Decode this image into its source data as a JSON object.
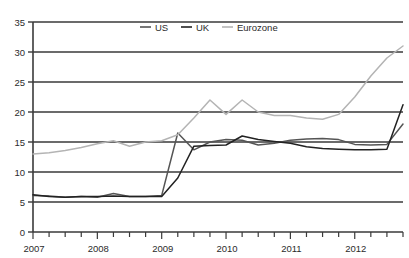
{
  "chart_data": {
    "type": "line",
    "title": "",
    "subtitle": "",
    "xlabel": "",
    "ylabel": "",
    "xlim": [
      2007.0,
      2012.75
    ],
    "ylim": [
      0,
      35
    ],
    "yticks": [
      0,
      5,
      10,
      15,
      20,
      25,
      30,
      35
    ],
    "xticks": [
      2007,
      2008,
      2009,
      2010,
      2011,
      2012
    ],
    "xtick_labels": [
      "2007",
      "2008",
      "2009",
      "2010",
      "2011",
      "2012"
    ],
    "minor_xtick_interval": 0.25,
    "grid": "horizontal",
    "legend_position": "top-center",
    "x": [
      2007.0,
      2007.25,
      2007.5,
      2007.75,
      2008.0,
      2008.25,
      2008.5,
      2008.75,
      2009.0,
      2009.25,
      2009.5,
      2009.75,
      2010.0,
      2010.25,
      2010.5,
      2010.75,
      2011.0,
      2011.25,
      2011.5,
      2011.75,
      2012.0,
      2012.25,
      2012.5,
      2012.75
    ],
    "series": [
      {
        "name": "US",
        "color": "#555555",
        "values": [
          6.1,
          6.0,
          5.8,
          5.9,
          5.8,
          6.4,
          5.9,
          5.9,
          6.1,
          16.5,
          13.7,
          15.0,
          15.4,
          15.3,
          14.5,
          14.8,
          15.3,
          15.5,
          15.6,
          15.4,
          14.6,
          14.5,
          14.6,
          18.0
        ]
      },
      {
        "name": "UK",
        "color": "#222222",
        "values": [
          6.2,
          5.9,
          5.8,
          5.9,
          5.9,
          6.0,
          5.9,
          5.9,
          5.9,
          9.0,
          14.3,
          14.4,
          14.5,
          16.0,
          15.4,
          15.1,
          14.8,
          14.2,
          13.9,
          13.8,
          13.7,
          13.7,
          13.8,
          21.2
        ]
      },
      {
        "name": "Eurozone",
        "color": "#b4b4b4",
        "values": [
          13.0,
          13.2,
          13.6,
          14.1,
          14.7,
          15.2,
          14.3,
          15.0,
          15.2,
          16.2,
          19.0,
          22.0,
          19.6,
          22.0,
          20.0,
          19.4,
          19.4,
          19.0,
          18.8,
          19.6,
          22.5,
          26.0,
          29.0,
          31.0
        ]
      }
    ],
    "legend": [
      {
        "label": "US",
        "color": "#555555"
      },
      {
        "label": "UK",
        "color": "#222222"
      },
      {
        "label": "Eurozone",
        "color": "#b4b4b4"
      }
    ],
    "axis_color": "#3a3a3a",
    "gridline_color": "#3a3a3a",
    "background_color": "#ffffff"
  }
}
